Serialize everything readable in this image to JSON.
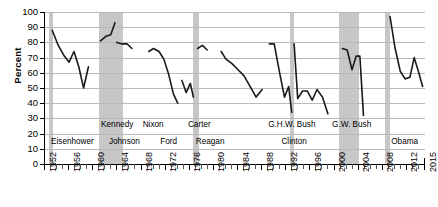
{
  "chart_data": {
    "type": "line",
    "title": "",
    "xlabel": "",
    "ylabel": "Percent",
    "ylim": [
      0,
      100
    ],
    "ytick_values": [
      0,
      10,
      20,
      30,
      40,
      50,
      60,
      70,
      80,
      90,
      100
    ],
    "xlim": [
      1952,
      2015
    ],
    "xtick_labels": [
      "1952",
      "1956",
      "1960",
      "1964",
      "1968",
      "1972",
      "1976",
      "1980",
      "1984",
      "1988",
      "1992",
      "1996",
      "2000",
      "2004",
      "2008",
      "2012",
      "2015"
    ],
    "grid": true,
    "legend": "none",
    "line_color": "#1a1a1a",
    "band_color": "#c2c2c2",
    "series": [
      {
        "name": "Approval",
        "segments": [
          {
            "president": "Eisenhower",
            "points": [
              [
                1953.2,
                88
              ],
              [
                1954.2,
                78
              ],
              [
                1955.2,
                71
              ],
              [
                1956.0,
                67
              ],
              [
                1956.8,
                74
              ],
              [
                1957.6,
                64
              ],
              [
                1958.4,
                50
              ],
              [
                1959.2,
                64
              ]
            ]
          },
          {
            "president": "Kennedy",
            "points": [
              [
                1961.2,
                81
              ],
              [
                1962.1,
                84
              ],
              [
                1962.9,
                85
              ],
              [
                1963.6,
                93
              ]
            ]
          },
          {
            "president": "Johnson",
            "points": [
              [
                1963.9,
                80
              ],
              [
                1964.8,
                79
              ],
              [
                1965.6,
                79
              ],
              [
                1966.4,
                76
              ]
            ]
          },
          {
            "president": "Nixon",
            "points": [
              [
                1969.2,
                74
              ],
              [
                1970.0,
                76
              ],
              [
                1970.9,
                74
              ],
              [
                1971.7,
                69
              ],
              [
                1972.5,
                59
              ],
              [
                1973.3,
                46
              ],
              [
                1974.0,
                40
              ]
            ]
          },
          {
            "president": "Ford",
            "points": [
              [
                1974.7,
                55
              ],
              [
                1975.4,
                47
              ],
              [
                1976.1,
                53
              ],
              [
                1976.6,
                44
              ]
            ]
          },
          {
            "president": "Carter",
            "points": [
              [
                1977.3,
                76
              ],
              [
                1978.1,
                78
              ],
              [
                1978.9,
                75
              ]
            ]
          },
          {
            "president": "Reagan",
            "points": [
              [
                1981.2,
                74
              ],
              [
                1982.0,
                69
              ],
              [
                1983.0,
                66
              ],
              [
                1984.0,
                62
              ],
              [
                1985.0,
                58
              ],
              [
                1986.0,
                51
              ],
              [
                1987.0,
                44
              ],
              [
                1988.0,
                49
              ]
            ]
          },
          {
            "president": "G.H.W. Bush",
            "points": [
              [
                1989.2,
                79
              ],
              [
                1990.0,
                79
              ],
              [
                1990.9,
                60
              ],
              [
                1991.7,
                44
              ],
              [
                1992.4,
                51
              ],
              [
                1992.9,
                34
              ]
            ]
          },
          {
            "president": "Clinton",
            "points": [
              [
                1993.3,
                79
              ],
              [
                1993.9,
                43
              ],
              [
                1994.7,
                48
              ],
              [
                1995.5,
                48
              ],
              [
                1996.3,
                42
              ],
              [
                1997.1,
                49
              ],
              [
                1998.0,
                44
              ],
              [
                1998.9,
                33
              ]
            ]
          },
          {
            "president": "G.W. Bush",
            "points": [
              [
                2001.3,
                76
              ],
              [
                2002.1,
                75
              ],
              [
                2002.9,
                62
              ],
              [
                2003.6,
                71
              ],
              [
                2004.2,
                71
              ],
              [
                2004.8,
                32
              ]
            ]
          },
          {
            "president": "Obama",
            "points": [
              [
                2009.2,
                97
              ],
              [
                2010.0,
                77
              ],
              [
                2010.9,
                61
              ],
              [
                2011.7,
                56
              ],
              [
                2012.5,
                57
              ],
              [
                2013.2,
                70
              ],
              [
                2013.9,
                61
              ],
              [
                2014.6,
                51
              ]
            ]
          }
        ]
      }
    ],
    "shaded_bands": [
      {
        "label": "transition-1953",
        "start": 1952.7,
        "end": 1953.4
      },
      {
        "label": "transition-1961-1965",
        "start": 1961.0,
        "end": 1964.9
      },
      {
        "label": "transition-1977",
        "start": 1976.6,
        "end": 1977.5
      },
      {
        "label": "transition-1993",
        "start": 1992.6,
        "end": 1993.3
      },
      {
        "label": "transition-2001-2005",
        "start": 2000.8,
        "end": 2004.0
      },
      {
        "label": "transition-2009",
        "start": 2008.4,
        "end": 2009.2
      }
    ],
    "president_labels_top": [
      {
        "name": "Kennedy",
        "x": 1961.3
      },
      {
        "name": "Nixon",
        "x": 1968.2
      },
      {
        "name": "Carter",
        "x": 1975.7
      },
      {
        "name": "G.H.W. Bush",
        "x": 1989.0
      },
      {
        "name": "G.W. Bush",
        "x": 1999.6
      }
    ],
    "president_labels_bottom": [
      {
        "name": "Eisenhower",
        "x": 1953.0
      },
      {
        "name": "Johnson",
        "x": 1962.6
      },
      {
        "name": "Ford",
        "x": 1971.1
      },
      {
        "name": "Reagan",
        "x": 1977.0
      },
      {
        "name": "Clinton",
        "x": 1991.2
      },
      {
        "name": "Obama",
        "x": 2009.4
      }
    ]
  }
}
